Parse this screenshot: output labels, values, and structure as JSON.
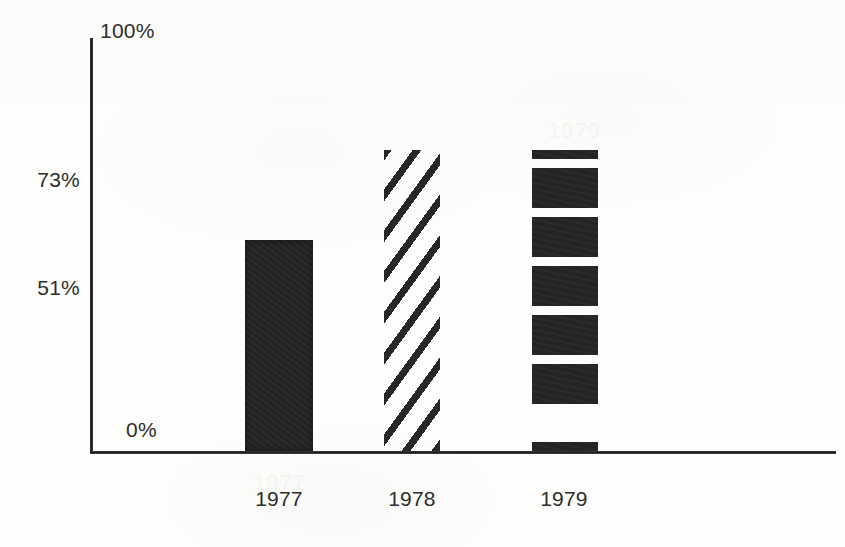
{
  "chart_data": {
    "type": "bar",
    "title": "",
    "subtitle": "",
    "xlabel": "",
    "ylabel": "",
    "categories": [
      "1977",
      "1978",
      "1979"
    ],
    "values": [
      51,
      73,
      73
    ],
    "ylim": [
      0,
      100
    ],
    "ytick_labels": [
      "100%",
      "73%",
      "51%",
      "0%"
    ],
    "ytick_values": [
      100,
      73,
      51,
      0
    ],
    "grid": false,
    "legend": "none",
    "bar_fills": [
      "solid-black",
      "diagonal-hatch",
      "horizontal-stripes"
    ],
    "series": [
      {
        "name": "",
        "values": [
          51,
          73,
          73
        ]
      }
    ],
    "annotations": []
  },
  "axes": {
    "y_ticks": [
      {
        "label": "100%",
        "value": 100,
        "position": "above-axis-right"
      },
      {
        "label": "73%",
        "value": 73,
        "position": "left"
      },
      {
        "label": "51%",
        "value": 51,
        "position": "left"
      },
      {
        "label": "0%",
        "value": 0,
        "position": "inside-right"
      }
    ],
    "x_ticks": [
      {
        "label": "1977"
      },
      {
        "label": "1978"
      },
      {
        "label": "1979"
      }
    ]
  },
  "bars": [
    {
      "category": "1977",
      "value": 51,
      "value_label": "51%",
      "fill": "solid-black"
    },
    {
      "category": "1978",
      "value": 73,
      "value_label": "73%",
      "fill": "diagonal-hatch"
    },
    {
      "category": "1979",
      "value": 73,
      "value_label": "73%",
      "fill": "horizontal-stripes"
    }
  ],
  "colors": {
    "ink": "#232323",
    "axis": "#1d1d1d",
    "paper": "#fdfdfb"
  },
  "ghosts": {
    "one": "1977",
    "two": "1979"
  }
}
